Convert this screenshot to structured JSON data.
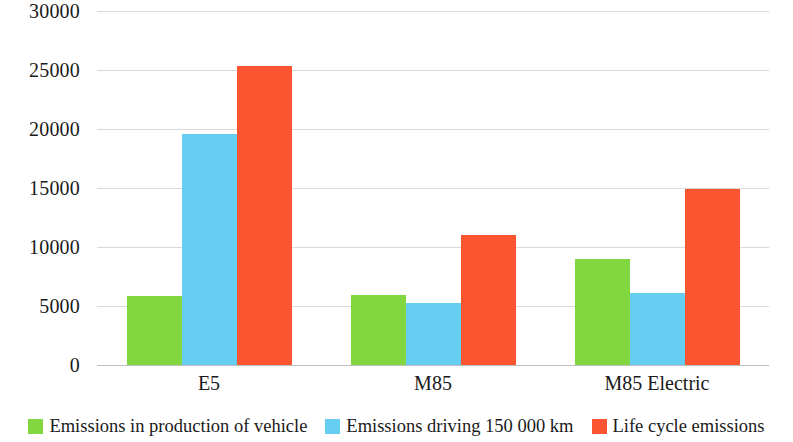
{
  "chart_data": {
    "type": "bar",
    "title": "",
    "subtitle": "",
    "xlabel": "",
    "ylabel": "",
    "categories": [
      "E5",
      "M85",
      "M85 Electric"
    ],
    "series": [
      {
        "name": "Emissions in production of vehicle",
        "color": "#82d741",
        "values": [
          5850,
          5930,
          8980
        ]
      },
      {
        "name": "Emissions driving 150 000 km",
        "color": "#66cef0",
        "values": [
          19580,
          5250,
          6100
        ]
      },
      {
        "name": "Life cycle emissions",
        "color": "#fa5530",
        "values": [
          25340,
          11020,
          14910
        ]
      }
    ],
    "ylim": [
      0,
      30000
    ],
    "ytick_labels": [
      "0",
      "5000",
      "10000",
      "15000",
      "20000",
      "25000",
      "30000"
    ],
    "ytick_values": [
      0,
      5000,
      10000,
      15000,
      20000,
      25000,
      30000
    ],
    "grid": true,
    "grid_axis": "y",
    "legend_position": "bottom",
    "legend_entries": [
      "Emissions in production of vehicle",
      "Emissions driving 150 000 km",
      "Life cycle emissions"
    ],
    "annotations": [],
    "background_color": "#ffffff",
    "gridline_color": "#d9d9d9",
    "text_color": "#1a1a1a"
  }
}
